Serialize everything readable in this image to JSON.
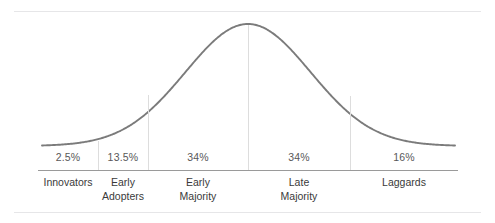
{
  "chart_data": {
    "type": "area",
    "title": "",
    "subtitle": "",
    "xlabel": "",
    "ylabel": "",
    "grid": false,
    "legend_position": "none",
    "curve": "normal-distribution-bell-curve",
    "curve_color": "#7b7b7b",
    "axis_color": "#9a9a9a",
    "divider_color": "#dddddd",
    "frame_color": "#e6e6e8",
    "categories": [
      "Innovators",
      "Early Adopters",
      "Early Majority",
      "Late Majority",
      "Laggards"
    ],
    "values": [
      2.5,
      13.5,
      34,
      34,
      16
    ],
    "value_labels": [
      "2.5%",
      "13.5%",
      "34%",
      "34%",
      "16%"
    ],
    "segments": [
      {
        "percent_label": "2.5%",
        "percent_value": 2.5,
        "name_line1": "Innovators",
        "name_line2": "",
        "x_start": 38,
        "x_end": 98,
        "center_x": 68
      },
      {
        "percent_label": "13.5%",
        "percent_value": 13.5,
        "name_line1": "Early",
        "name_line2": "Adopters",
        "x_start": 98,
        "x_end": 148,
        "center_x": 123
      },
      {
        "percent_label": "34%",
        "percent_value": 34,
        "name_line1": "Early",
        "name_line2": "Majority",
        "x_start": 148,
        "x_end": 248,
        "center_x": 198
      },
      {
        "percent_label": "34%",
        "percent_value": 34,
        "name_line1": "Late",
        "name_line2": "Majority",
        "x_start": 248,
        "x_end": 350,
        "center_x": 299
      },
      {
        "percent_label": "16%",
        "percent_value": 16,
        "name_line1": "Laggards",
        "name_line2": "",
        "x_start": 350,
        "x_end": 458,
        "center_x": 404
      }
    ],
    "dividers": [
      {
        "x": 98,
        "top": 141,
        "bottom": 170
      },
      {
        "x": 148,
        "top": 95,
        "bottom": 170
      },
      {
        "x": 248,
        "top": 25,
        "bottom": 170
      },
      {
        "x": 350,
        "top": 96,
        "bottom": 170
      }
    ],
    "axis": {
      "x_start": 38,
      "x_end": 458,
      "y": 170
    },
    "peak": {
      "x": 248,
      "y": 24
    },
    "baseline_y": 146
  }
}
